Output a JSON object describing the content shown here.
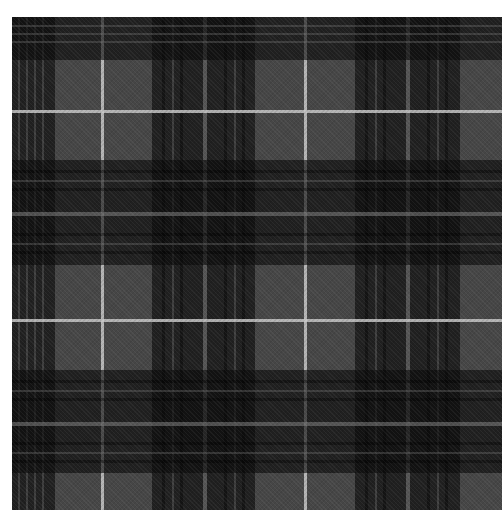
{
  "image": {
    "subject": "grey and black tartan plaid fabric swatch",
    "background_color": "#ffffff",
    "fabric_bounds": {
      "left": 12,
      "top": 17,
      "right": 502,
      "bottom": 510
    }
  },
  "colors": {
    "base_grey": "#464646",
    "dark_band": "rgba(10,10,10,0.62)",
    "fine_dark_stripe": "rgba(0,0,0,0.35)",
    "fine_grey_stripe": "rgba(120,120,120,0.35)",
    "white_line": "rgba(200,200,200,0.85)",
    "light_grey_line": "rgba(130,130,130,0.55)"
  },
  "vertical_stripes": [
    {
      "x": 0,
      "w": 43,
      "color": "dark_band"
    },
    {
      "x": 6,
      "w": 2,
      "color": "fine_grey_stripe"
    },
    {
      "x": 14,
      "w": 2,
      "color": "fine_grey_stripe"
    },
    {
      "x": 22,
      "w": 2,
      "color": "fine_grey_stripe"
    },
    {
      "x": 30,
      "w": 2,
      "color": "fine_grey_stripe"
    },
    {
      "x": 89,
      "w": 3,
      "color": "white_line"
    },
    {
      "x": 140,
      "w": 103,
      "color": "dark_band"
    },
    {
      "x": 150,
      "w": 3,
      "color": "fine_dark_stripe"
    },
    {
      "x": 160,
      "w": 2,
      "color": "fine_grey_stripe"
    },
    {
      "x": 168,
      "w": 3,
      "color": "fine_dark_stripe"
    },
    {
      "x": 191,
      "w": 4,
      "color": "light_grey_line"
    },
    {
      "x": 212,
      "w": 3,
      "color": "fine_dark_stripe"
    },
    {
      "x": 222,
      "w": 2,
      "color": "fine_grey_stripe"
    },
    {
      "x": 230,
      "w": 3,
      "color": "fine_dark_stripe"
    },
    {
      "x": 292,
      "w": 3,
      "color": "white_line"
    },
    {
      "x": 343,
      "w": 105,
      "color": "dark_band"
    },
    {
      "x": 353,
      "w": 3,
      "color": "fine_dark_stripe"
    },
    {
      "x": 363,
      "w": 2,
      "color": "fine_grey_stripe"
    },
    {
      "x": 371,
      "w": 3,
      "color": "fine_dark_stripe"
    },
    {
      "x": 394,
      "w": 4,
      "color": "light_grey_line"
    },
    {
      "x": 415,
      "w": 3,
      "color": "fine_dark_stripe"
    },
    {
      "x": 425,
      "w": 2,
      "color": "fine_grey_stripe"
    },
    {
      "x": 433,
      "w": 3,
      "color": "fine_dark_stripe"
    }
  ],
  "horizontal_stripes": [
    {
      "y": 0,
      "h": 43,
      "color": "dark_band"
    },
    {
      "y": 8,
      "h": 2,
      "color": "fine_grey_stripe"
    },
    {
      "y": 16,
      "h": 2,
      "color": "fine_grey_stripe"
    },
    {
      "y": 24,
      "h": 2,
      "color": "fine_grey_stripe"
    },
    {
      "y": 93,
      "h": 3,
      "color": "white_line"
    },
    {
      "y": 143,
      "h": 105,
      "color": "dark_band"
    },
    {
      "y": 153,
      "h": 3,
      "color": "fine_dark_stripe"
    },
    {
      "y": 163,
      "h": 2,
      "color": "fine_grey_stripe"
    },
    {
      "y": 171,
      "h": 3,
      "color": "fine_dark_stripe"
    },
    {
      "y": 195,
      "h": 4,
      "color": "light_grey_line"
    },
    {
      "y": 216,
      "h": 3,
      "color": "fine_dark_stripe"
    },
    {
      "y": 226,
      "h": 2,
      "color": "fine_grey_stripe"
    },
    {
      "y": 234,
      "h": 3,
      "color": "fine_dark_stripe"
    },
    {
      "y": 302,
      "h": 3,
      "color": "white_line"
    },
    {
      "y": 353,
      "h": 103,
      "color": "dark_band"
    },
    {
      "y": 363,
      "h": 3,
      "color": "fine_dark_stripe"
    },
    {
      "y": 373,
      "h": 2,
      "color": "fine_grey_stripe"
    },
    {
      "y": 381,
      "h": 3,
      "color": "fine_dark_stripe"
    },
    {
      "y": 405,
      "h": 4,
      "color": "light_grey_line"
    },
    {
      "y": 425,
      "h": 3,
      "color": "fine_dark_stripe"
    },
    {
      "y": 435,
      "h": 2,
      "color": "fine_grey_stripe"
    },
    {
      "y": 443,
      "h": 3,
      "color": "fine_dark_stripe"
    }
  ]
}
